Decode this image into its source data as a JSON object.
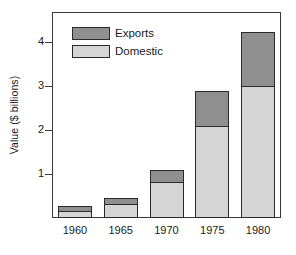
{
  "chart_data": {
    "type": "bar",
    "subtype": "stacked-vertical",
    "title": "",
    "xlabel": "",
    "ylabel": "Value ($ billions)",
    "categories": [
      "1960",
      "1965",
      "1970",
      "1975",
      "1980"
    ],
    "series": [
      {
        "name": "Domestic",
        "color": "#d5d5d5",
        "values": [
          0.16,
          0.32,
          0.82,
          2.1,
          3.0
        ]
      },
      {
        "name": "Exports",
        "color": "#8f8f8f",
        "values": [
          0.11,
          0.13,
          0.27,
          0.78,
          1.22
        ]
      }
    ],
    "totals": [
      0.27,
      0.45,
      1.09,
      2.88,
      4.22
    ],
    "stack_order_bottom_to_top": [
      "Domestic",
      "Exports"
    ],
    "ylim": [
      0.0,
      4.68
    ],
    "yticks": [
      1,
      2,
      3,
      4
    ],
    "ytick_labels": [
      "1",
      "2",
      "3",
      "4"
    ],
    "grid": false,
    "legend": {
      "position": "top-left-inside",
      "entries": [
        {
          "label": "Exports",
          "color": "#8f8f8f"
        },
        {
          "label": "Domestic",
          "color": "#d5d5d5"
        }
      ]
    },
    "axis_color": "#3a3a3a",
    "bar_edge_color": "#2b2b2b",
    "background": "#ffffff"
  }
}
